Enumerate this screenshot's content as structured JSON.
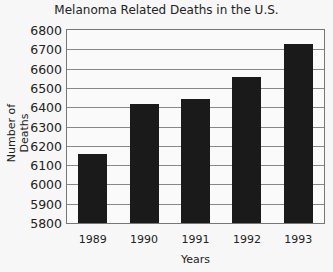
{
  "chart_data": {
    "type": "bar",
    "title": "Melanoma Related Deaths in the U.S.",
    "xlabel": "Years",
    "ylabel": "Number of Deaths",
    "categories": [
      "1989",
      "1990",
      "1991",
      "1992",
      "1993"
    ],
    "values": [
      6160,
      6415,
      6440,
      6555,
      6725
    ],
    "ylim": [
      5800,
      6800
    ],
    "yticks": [
      "6800",
      "6700",
      "6600",
      "6500",
      "6400",
      "6300",
      "6200",
      "6100",
      "6000",
      "5900",
      "5800"
    ],
    "grid": true,
    "legend": null,
    "bar_color": "#1a1a1a"
  }
}
